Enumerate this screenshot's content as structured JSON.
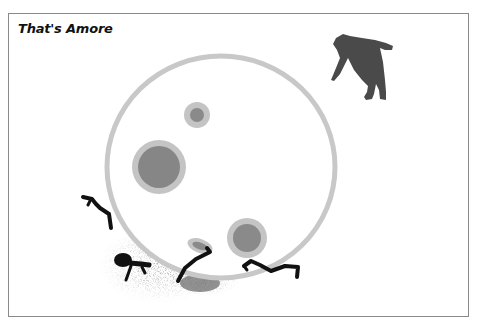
{
  "title": "That's Amore",
  "scene": {
    "moon_ring_color": "#c8c8c8",
    "crater_outer_color": "#c4c4c4",
    "crater_inner_color": "#8a8a8a",
    "bear_color": "#4a4a4a",
    "figure_color": "#111111"
  }
}
